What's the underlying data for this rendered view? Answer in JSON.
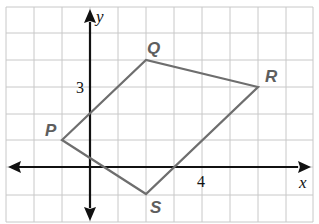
{
  "diagram": {
    "type": "coordinate-plane",
    "axes": {
      "x_label": "x",
      "y_label": "y"
    },
    "tick_labels": {
      "x_tick": "4",
      "y_tick": "3"
    },
    "grid": {
      "x_min": -3,
      "x_max": 8,
      "y_min": -2,
      "y_max": 6
    },
    "quadrilateral": {
      "name": "PQRS",
      "vertices": [
        {
          "label": "P",
          "x": -1,
          "y": 1
        },
        {
          "label": "Q",
          "x": 2,
          "y": 4
        },
        {
          "label": "R",
          "x": 6,
          "y": 3
        },
        {
          "label": "S",
          "x": 2,
          "y": -1
        }
      ]
    },
    "colors": {
      "grid": "#c8c8c8",
      "axes": "#111111",
      "polygon": "#6e6e6e",
      "vertex_labels": "#5e5e5e"
    }
  }
}
